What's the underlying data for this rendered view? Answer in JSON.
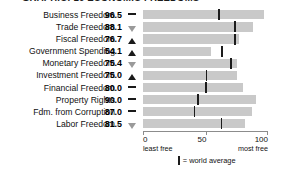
{
  "chart_data": {
    "type": "bar",
    "title": "GRAPHIC: 10 ECONOMIC FREEDOMS",
    "xlabel": "",
    "ylabel": "",
    "xlim": [
      0,
      100
    ],
    "grid": false,
    "orientation": "horizontal",
    "categories": [
      "Business Freedom",
      "Trade Freedom",
      "Fiscal Freedom",
      "Government Spending",
      "Monetary Freedom",
      "Investment Freedom",
      "Financial Freedom",
      "Property Rights",
      "Fdm. from Corruption",
      "Labor Freedom"
    ],
    "values": [
      96.5,
      88.1,
      76.7,
      54.1,
      75.4,
      75.0,
      80.0,
      90.0,
      87.0,
      81.5
    ],
    "value_labels": [
      "96.5",
      "88.1",
      "76.7",
      "54.1",
      "75.4",
      "75.0",
      "80.0",
      "90.0",
      "87.0",
      "81.5"
    ],
    "trends": [
      "flat",
      "down",
      "up",
      "up",
      "down",
      "up",
      "flat",
      "flat",
      "flat",
      "down"
    ],
    "world_average": [
      60.0,
      73.0,
      73.0,
      62.5,
      69.5,
      50.0,
      49.5,
      43.5,
      40.5,
      62.0
    ],
    "tick_values": [
      0,
      50,
      100
    ],
    "tick_labels": [
      "0",
      "50",
      "100"
    ],
    "axis_captions": {
      "left": "least free",
      "right": "most free"
    },
    "legend": {
      "marker_label": "= world average",
      "position": "bottom-center"
    },
    "colors": {
      "bar": "#c9c9c9",
      "average_marker": "#1c1c1c",
      "axis": "#8c8c8c",
      "trend_up": "#1a1a1a",
      "trend_down": "#9a9a9a",
      "text": "#111111"
    }
  }
}
